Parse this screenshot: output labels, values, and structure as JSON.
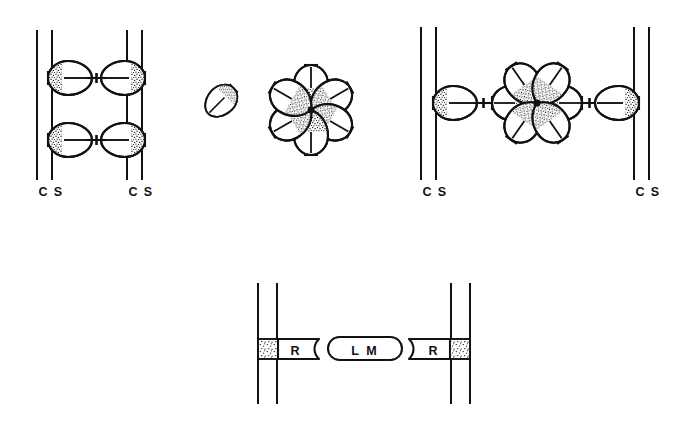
{
  "figure": {
    "type": "diagram",
    "style": "hand-drawn line art, black ink on white",
    "background_color": "#ffffff",
    "ink_color": "#111111",
    "width": 688,
    "height": 421,
    "panels": [
      {
        "id": "panel-top-left",
        "description": "Two pairs of parallel vertical lines (cell surfaces) facing each other; two rows of egg-shaped bodies attached to the inner faces, each pair joined by a short dumbbell linker.",
        "labels": [
          {
            "text": "C",
            "x": 43,
            "y": 194
          },
          {
            "text": "S",
            "x": 57,
            "y": 194
          },
          {
            "text": "C",
            "x": 133,
            "y": 194
          },
          {
            "text": "S",
            "x": 147,
            "y": 194
          }
        ],
        "line_pairs": [
          {
            "x_outer": 37,
            "x_inner": 52,
            "y_top": 30,
            "y_bottom": 180
          },
          {
            "x_outer": 127,
            "x_inner": 142,
            "y_top": 30,
            "y_bottom": 180
          }
        ],
        "bodies": [
          {
            "row": 1,
            "side": "left",
            "cx": 70,
            "cy": 78,
            "stipple_end": "left"
          },
          {
            "row": 1,
            "side": "right",
            "cx": 123,
            "cy": 78,
            "stipple_end": "right"
          },
          {
            "row": 2,
            "side": "left",
            "cx": 70,
            "cy": 140,
            "stipple_end": "left"
          },
          {
            "row": 2,
            "side": "right",
            "cx": 123,
            "cy": 140,
            "stipple_end": "right"
          }
        ],
        "linkers": [
          {
            "y": 78,
            "x1": 88,
            "x2": 106
          },
          {
            "y": 140,
            "x1": 88,
            "x2": 106
          }
        ]
      },
      {
        "id": "panel-top-middle",
        "description": "A single free oblique egg-shaped body with a stippled distal end, beside a six-petal rosette whose petals radiate from a stippled hub.",
        "free_body": {
          "cx": 221,
          "cy": 101,
          "angle_deg": 42,
          "stipple_end": "distal"
        },
        "rosette": {
          "cx": 311,
          "cy": 108,
          "petal_count": 6,
          "hub_stippled": true,
          "petal_angles_deg": [
            270,
            330,
            30,
            90,
            150,
            210
          ]
        }
      },
      {
        "id": "panel-top-right",
        "description": "Two widely separated pairs of parallel vertical lines; an egg-shaped body on each inner face, each joined by a dumbbell linker to a central six-petal rosette.",
        "labels": [
          {
            "text": "C",
            "x": 427,
            "y": 194
          },
          {
            "text": "S",
            "x": 441,
            "y": 194
          },
          {
            "text": "C",
            "x": 640,
            "y": 194
          },
          {
            "text": "S",
            "x": 654,
            "y": 194
          }
        ],
        "line_pairs": [
          {
            "x_outer": 421,
            "x_inner": 436,
            "y_top": 27,
            "y_bottom": 180
          },
          {
            "x_outer": 634,
            "x_inner": 649,
            "y_top": 27,
            "y_bottom": 180
          }
        ],
        "bodies": [
          {
            "side": "left",
            "cx": 455,
            "cy": 103,
            "stipple_end": "left"
          },
          {
            "side": "right",
            "cx": 617,
            "cy": 103,
            "stipple_end": "right"
          }
        ],
        "linkers": [
          {
            "y": 103,
            "x1": 474,
            "x2": 493
          },
          {
            "y": 103,
            "x1": 580,
            "x2": 599
          }
        ],
        "rosette": {
          "cx": 537,
          "cy": 103,
          "petal_count": 6,
          "hub_stippled": true,
          "petal_angles_deg": [
            0,
            180,
            305,
            235,
            55,
            125
          ]
        }
      },
      {
        "id": "panel-bottom",
        "description": "Legend-style cross section: a pair of vertical lines at each end with a stippled square embedded in the membrane, an R box abutting it with a concave inner edge, and a rounded L M capsule nested between the two R boxes.",
        "line_pairs": [
          {
            "x_outer": 257,
            "x_inner": 276,
            "y_top": 283,
            "y_bottom": 404
          },
          {
            "x_outer": 452,
            "x_inner": 471,
            "y_top": 283,
            "y_bottom": 404
          },
          {
            "x_outer": 452,
            "x_inner": 471,
            "y_top": 283,
            "y_bottom": 404
          }
        ],
        "stipple_squares": [
          {
            "x": 258,
            "y": 339,
            "w": 20,
            "h": 19
          },
          {
            "x": 450,
            "y": 339,
            "w": 20,
            "h": 19
          }
        ],
        "boxes": [
          {
            "label": "R",
            "x": 278,
            "y": 339,
            "w": 41,
            "h": 19,
            "notch_side": "right"
          },
          {
            "label": "R",
            "x": 409,
            "y": 339,
            "w": 41,
            "h": 19,
            "notch_side": "left"
          }
        ],
        "capsule": {
          "label": "L M",
          "x": 328,
          "y": 337,
          "w": 74,
          "h": 23
        }
      }
    ],
    "legend_terms": [
      {
        "abbr": "C",
        "meaning": "C"
      },
      {
        "abbr": "S",
        "meaning": "S"
      },
      {
        "abbr": "R",
        "meaning": "R"
      },
      {
        "abbr": "L M",
        "meaning": "L M"
      }
    ]
  }
}
